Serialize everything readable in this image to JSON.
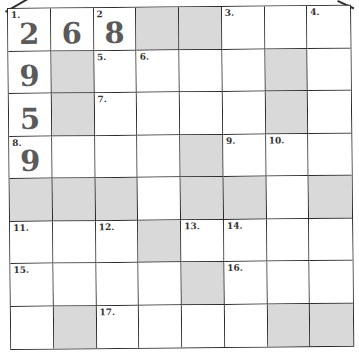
{
  "puzzle": {
    "type": "number-crossword",
    "rows": 8,
    "cols": 8,
    "colors": {
      "shaded": "#d9d9d9",
      "empty": "#ffffff",
      "lines": "#2a2a2a",
      "digits": "#5a5a5a"
    },
    "cells": [
      [
        {
          "n": "1.",
          "v": "2"
        },
        {
          "v": "6"
        },
        {
          "n": "2",
          "v": "8"
        },
        {
          "s": 1
        },
        {
          "s": 1
        },
        {
          "n": "3."
        },
        {},
        {
          "n": "4."
        }
      ],
      [
        {
          "v": "9"
        },
        {
          "s": 1
        },
        {
          "n": "5."
        },
        {
          "n": "6."
        },
        {},
        {},
        {
          "s": 1
        },
        {}
      ],
      [
        {
          "v": "5"
        },
        {
          "s": 1
        },
        {
          "n": "7."
        },
        {},
        {},
        {},
        {
          "s": 1
        },
        {}
      ],
      [
        {
          "n": "8.",
          "v": "9"
        },
        {},
        {},
        {},
        {
          "s": 1
        },
        {
          "n": "9."
        },
        {
          "n": "10."
        },
        {}
      ],
      [
        {
          "s": 1
        },
        {
          "s": 1
        },
        {
          "s": 1
        },
        {},
        {
          "s": 1
        },
        {
          "s": 1
        },
        {},
        {
          "s": 1
        }
      ],
      [
        {
          "n": "11."
        },
        {},
        {
          "n": "12."
        },
        {
          "s": 1
        },
        {
          "n": "13."
        },
        {
          "n": "14."
        },
        {},
        {}
      ],
      [
        {
          "n": "15."
        },
        {},
        {},
        {},
        {
          "s": 1
        },
        {
          "n": "16."
        },
        {},
        {}
      ],
      [
        {},
        {
          "s": 1
        },
        {
          "n": "17."
        },
        {},
        {},
        {},
        {
          "s": 1
        },
        {
          "s": 1
        }
      ]
    ]
  }
}
